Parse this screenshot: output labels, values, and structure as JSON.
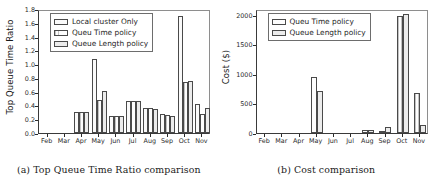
{
  "figure": {
    "subfigures": [
      {
        "caption": "(a) Top Queue Time Ratio comparison",
        "legend": {
          "entries": [
            {
              "label": "Local cluster Only",
              "swatch": "hatch-a"
            },
            {
              "label": "Queu Time policy",
              "swatch": "hatch-b"
            },
            {
              "label": "Queue Length policy",
              "swatch": "hatch-c"
            }
          ]
        }
      },
      {
        "caption": "(b) Cost comparison",
        "legend": {
          "entries": [
            {
              "label": "Queu Time policy",
              "swatch": "hatch-b"
            },
            {
              "label": "Queue Length policy",
              "swatch": "hatch-c"
            }
          ]
        }
      }
    ]
  },
  "chart_data": [
    {
      "type": "bar",
      "title": "",
      "subfigure_label": "(a)",
      "caption": "(a) Top Queue Time Ratio comparison",
      "xlabel": "",
      "ylabel": "Top Queue Time Ratio",
      "ylim": [
        0,
        1.8
      ],
      "yticks": [
        "0.0",
        "0.2",
        "0.4",
        "0.6",
        "0.8",
        "1.0",
        "1.2",
        "1.4",
        "1.6",
        "1.8"
      ],
      "ytick_values": [
        0.0,
        0.2,
        0.4,
        0.6,
        0.8,
        1.0,
        1.2,
        1.4,
        1.6,
        1.8
      ],
      "grid": false,
      "legend_position": "upper left",
      "categories": [
        "Feb",
        "Mar",
        "Apr",
        "May",
        "Jun",
        "Jul",
        "Aug",
        "Sep",
        "Oct",
        "Nov"
      ],
      "series": [
        {
          "name": "Local cluster Only",
          "values": [
            0,
            0,
            0.31,
            1.07,
            0.25,
            0.47,
            0.37,
            0.27,
            1.7,
            0.42
          ]
        },
        {
          "name": "Queu Time policy",
          "values": [
            0,
            0,
            0.3,
            0.48,
            0.25,
            0.47,
            0.36,
            0.26,
            0.74,
            0.27
          ]
        },
        {
          "name": "Queue Length policy",
          "values": [
            0,
            0,
            0.3,
            0.61,
            0.25,
            0.47,
            0.35,
            0.25,
            0.75,
            0.37
          ]
        }
      ]
    },
    {
      "type": "bar",
      "title": "",
      "subfigure_label": "(b)",
      "caption": "(b) Cost comparison",
      "xlabel": "",
      "ylabel": "Cost ($)",
      "ylim": [
        0,
        2100
      ],
      "yticks": [
        "0",
        "500",
        "1000",
        "1500",
        "2000"
      ],
      "ytick_values": [
        0,
        500,
        1000,
        1500,
        2000
      ],
      "grid": false,
      "legend_position": "upper left",
      "categories": [
        "Feb",
        "Mar",
        "Apr",
        "May",
        "Jun",
        "Jul",
        "Aug",
        "Sep",
        "Oct",
        "Nov"
      ],
      "series": [
        {
          "name": "Queu Time policy",
          "values": [
            0,
            0,
            0,
            955,
            0,
            0,
            45,
            10,
            1985,
            680
          ]
        },
        {
          "name": "Queue Length policy",
          "values": [
            0,
            0,
            0,
            720,
            0,
            0,
            55,
            110,
            2010,
            130
          ]
        }
      ]
    }
  ]
}
